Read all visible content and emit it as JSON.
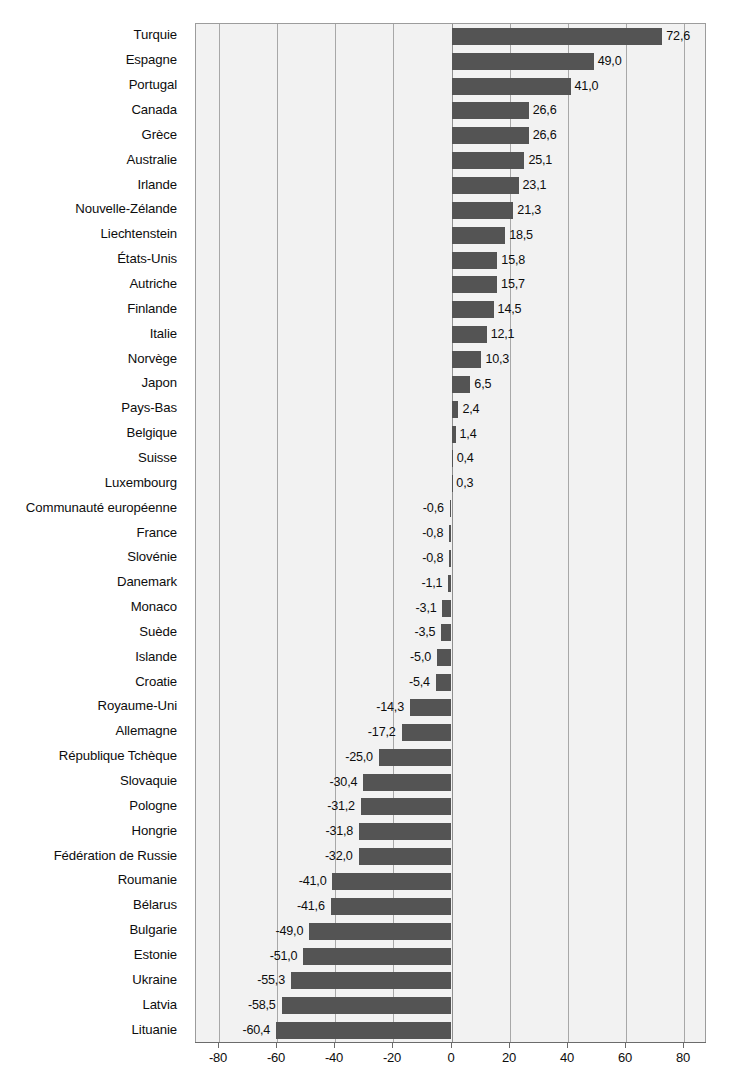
{
  "chart_data": {
    "type": "bar",
    "orientation": "horizontal",
    "title": "",
    "subtitle": "",
    "xlabel": "",
    "ylabel": "",
    "xlim": [
      -88,
      88
    ],
    "xticks": [
      -80,
      -60,
      -40,
      -20,
      0,
      20,
      40,
      60,
      80
    ],
    "xticklabels": [
      "-80",
      "-60",
      "-40",
      "-20",
      "0",
      "20",
      "40",
      "60",
      "80"
    ],
    "grid": true,
    "grid_axis": "x",
    "legend": "none",
    "decimal_separator": ",",
    "bar_color": "#545454",
    "plot_background": "#f2f2f2",
    "gridline_color": "#a8a8a8",
    "categories": [
      "Turquie",
      "Espagne",
      "Portugal",
      "Canada",
      "Grèce",
      "Australie",
      "Irlande",
      "Nouvelle-Zélande",
      "Liechtenstein",
      "États-Unis",
      "Autriche",
      "Finlande",
      "Italie",
      "Norvège",
      "Japon",
      "Pays-Bas",
      "Belgique",
      "Suisse",
      "Luxembourg",
      "Communauté européenne",
      "France",
      "Slovénie",
      "Danemark",
      "Monaco",
      "Suède",
      "Islande",
      "Croatie",
      "Royaume-Uni",
      "Allemagne",
      "République Tchèque",
      "Slovaquie",
      "Pologne",
      "Hongrie",
      "Fédération de Russie",
      "Roumanie",
      "Bélarus",
      "Bulgarie",
      "Estonie",
      "Ukraine",
      "Latvia",
      "Lituanie"
    ],
    "values": [
      72.6,
      49.0,
      41.0,
      26.6,
      26.6,
      25.1,
      23.1,
      21.3,
      18.5,
      15.8,
      15.7,
      14.5,
      12.1,
      10.3,
      6.5,
      2.4,
      1.4,
      0.4,
      0.3,
      -0.6,
      -0.8,
      -0.8,
      -1.1,
      -3.1,
      -3.5,
      -5.0,
      -5.4,
      -14.3,
      -17.2,
      -25.0,
      -30.4,
      -31.2,
      -31.8,
      -32.0,
      -41.0,
      -41.6,
      -49.0,
      -51.0,
      -55.3,
      -58.5,
      -60.4
    ],
    "value_labels": [
      "72,6",
      "49,0",
      "41,0",
      "26,6",
      "26,6",
      "25,1",
      "23,1",
      "21,3",
      "18,5",
      "15,8",
      "15,7",
      "14,5",
      "12,1",
      "10,3",
      "6,5",
      "2,4",
      "1,4",
      "0,4",
      "0,3",
      "-0,6",
      "-0,8",
      "-0,8",
      "-1,1",
      "-3,1",
      "-3,5",
      "-5,0",
      "-5,4",
      "-14,3",
      "-17,2",
      "-25,0",
      "-30,4",
      "-31,2",
      "-31,8",
      "-32,0",
      "-41,0",
      "-41,6",
      "-49,0",
      "-51,0",
      "-55,3",
      "-58,5",
      "-60,4"
    ]
  }
}
